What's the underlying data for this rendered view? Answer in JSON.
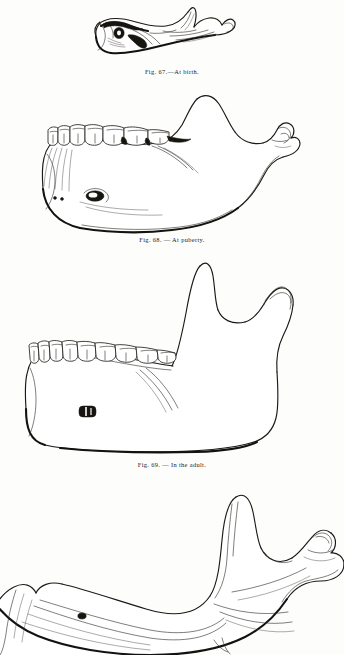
{
  "plate": {
    "subject": "Development of the mandible (lower jaw) at four stages of life",
    "page_background": "#fdfdfc",
    "ink_color": "#1b1916",
    "figure_count": 4
  },
  "figures": [
    {
      "id": "fig-67",
      "fig_number": "Fig. 67.",
      "title": "At birth",
      "caption": "Fig.  67.—At birth.",
      "stage": "newborn",
      "description": "Shallow elongated mandible with very obtuse angle, low ramus and undeveloped alveolar border",
      "has_teeth": false,
      "has_mental_foramen": true,
      "caption_visible": true
    },
    {
      "id": "fig-68",
      "fig_number": "Fig. 68.",
      "title": "At puberty",
      "caption": "Fig. 68. — At puberty.",
      "stage": "puberty",
      "description": "Deep body with broad crowded teeth, rising ramus and well formed condyle",
      "has_teeth": true,
      "tooth_count": 7,
      "has_mental_foramen": true,
      "caption_visible": true
    },
    {
      "id": "fig-69",
      "fig_number": "Fig. 69.",
      "title": "In the adult",
      "caption": "Fig. 69. — In the adult.",
      "stage": "adult",
      "description": "Full adult mandible with tall vertical ramus, coronoid process, sigmoid notch and condyle; slender upright teeth",
      "has_teeth": true,
      "tooth_count": 8,
      "has_mental_foramen": true,
      "caption_visible": true
    },
    {
      "id": "fig-70",
      "fig_number": "",
      "title": "In old age",
      "caption": "",
      "stage": "old-age",
      "description": "Edentulous mandible with absorbed alveolar border and obtuse angle; cropped at foot of page",
      "has_teeth": false,
      "has_mental_foramen": true,
      "caption_visible": false,
      "cropped_at_page_edge": true
    }
  ],
  "labels": {
    "mental_foramen": "mental foramen",
    "condyle": "condyle",
    "coronoid_process": "coronoid process",
    "sigmoid_notch": "sigmoid notch",
    "ramus": "ramus",
    "body": "body",
    "angle": "angle"
  }
}
